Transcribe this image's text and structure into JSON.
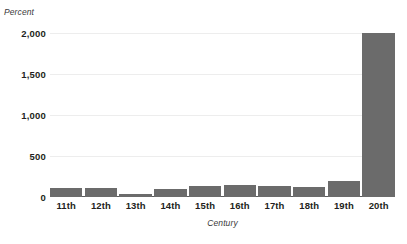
{
  "chart_data": {
    "type": "bar",
    "title": "",
    "subtitle": "",
    "xlabel": "Century",
    "ylabel": "Percent",
    "categories": [
      "11th",
      "12th",
      "13th",
      "14th",
      "15th",
      "16th",
      "17th",
      "18th",
      "19th",
      "20th"
    ],
    "values": [
      110,
      110,
      40,
      100,
      130,
      150,
      130,
      120,
      200,
      2000
    ],
    "ylim": [
      0,
      2000
    ],
    "y_ticks": [
      0,
      500,
      1000,
      1500,
      2000
    ],
    "y_tick_labels": [
      "0",
      "500",
      "1,000",
      "1,500",
      "2,000"
    ],
    "grid": "horizontal",
    "legend": "none",
    "bar_color": "#6b6b6b",
    "gridline_color": "#ededed",
    "axis_color": "#58595b",
    "series": [
      {
        "name": "Percent",
        "values": [
          110,
          110,
          40,
          100,
          130,
          150,
          130,
          120,
          200,
          2000
        ]
      }
    ]
  }
}
